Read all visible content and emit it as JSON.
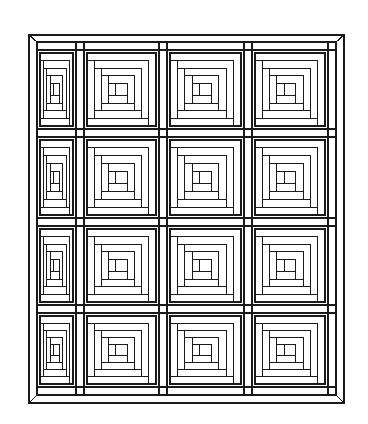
{
  "figure": {
    "stroke_color": "#1a1a1a",
    "background_color": "#ffffff",
    "frame": {
      "outer": {
        "x": 29,
        "y": 35,
        "w": 315,
        "h": 368
      },
      "inner": {
        "x": 37,
        "y": 42,
        "w": 299,
        "h": 353
      }
    },
    "grid": {
      "rows": 4,
      "cols": 4,
      "col_x": [
        37,
        80,
        163,
        248,
        336
      ],
      "row_y": [
        42,
        133,
        222,
        309,
        395
      ],
      "sash": 8
    },
    "block": {
      "rings": 4,
      "style": "log-cabin-spiral"
    }
  }
}
